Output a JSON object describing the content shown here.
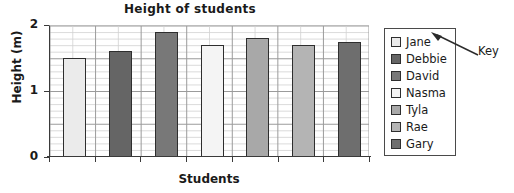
{
  "chart_data": {
    "type": "bar",
    "title": "Height of students",
    "xlabel": "Students",
    "ylabel": "Height (m)",
    "categories": [
      "Jane",
      "Debbie",
      "David",
      "Nasma",
      "Tyla",
      "Rae",
      "Gary"
    ],
    "values": [
      1.5,
      1.6,
      1.9,
      1.7,
      1.8,
      1.7,
      1.75
    ],
    "ylim": [
      0,
      2
    ],
    "yticks": [
      0,
      1,
      2
    ],
    "ytick_labels": [
      "0",
      "1",
      "2"
    ],
    "grid": true,
    "grid_minor_step": 0.1,
    "grid_major_step": 0.5,
    "legend_position": "right",
    "bar_colors": [
      "#ebebeb",
      "#656565",
      "#787878",
      "#f4f4f4",
      "#a8a8a8",
      "#b4b4b4",
      "#6e6e6e"
    ],
    "annotations": [
      {
        "text": "Key",
        "target": "legend"
      }
    ]
  },
  "legend": {
    "items": [
      {
        "label": "Jane",
        "color": "#ebebeb"
      },
      {
        "label": "Debbie",
        "color": "#656565"
      },
      {
        "label": "David",
        "color": "#787878"
      },
      {
        "label": "Nasma",
        "color": "#f4f4f4"
      },
      {
        "label": "Tyla",
        "color": "#a8a8a8"
      },
      {
        "label": "Rae",
        "color": "#b4b4b4"
      },
      {
        "label": "Gary",
        "color": "#6e6e6e"
      }
    ]
  },
  "annotation": {
    "key_label": "Key"
  }
}
